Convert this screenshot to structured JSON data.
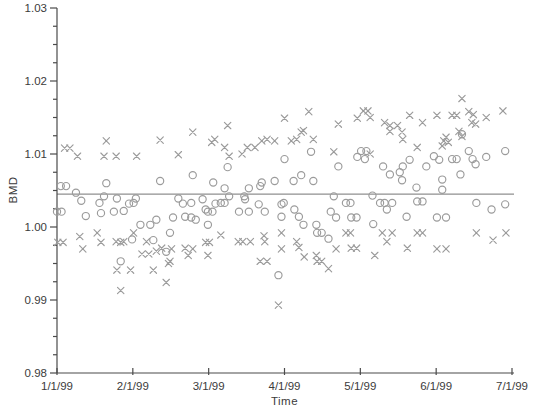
{
  "figure": {
    "background": "#ffffff",
    "axis_color": "#4a4a4a",
    "text_color": "#3b3b3b",
    "marker_color": "#9b9b9b",
    "ref_line_color": "#8f8f8f"
  },
  "chart_data": {
    "type": "scatter",
    "title": "",
    "xlabel": "Time",
    "ylabel": "BMD",
    "x_tick_labels": [
      "1/1/99",
      "2/1/99",
      "3/1/99",
      "4/1/99",
      "5/1/99",
      "6/1/99",
      "7/1/99"
    ],
    "x_range_months": [
      0,
      6
    ],
    "ylim": [
      0.98,
      1.03
    ],
    "y_ticks": [
      0.98,
      0.99,
      1.0,
      1.01,
      1.02,
      1.03
    ],
    "y_minor_step": 0.0025,
    "grid": "off",
    "legend": "none",
    "reference_line_y": 1.0045,
    "series": [
      {
        "name": "circle-series",
        "marker": "circle",
        "points": [
          [
            0.05,
            1.0056
          ],
          [
            0.12,
            1.0056
          ],
          [
            0.0,
            1.0021
          ],
          [
            0.06,
            1.0021
          ],
          [
            0.25,
            1.0047
          ],
          [
            0.32,
            1.0036
          ],
          [
            0.38,
            1.0015
          ],
          [
            0.56,
            1.0033
          ],
          [
            0.58,
            1.0019
          ],
          [
            0.62,
            1.0042
          ],
          [
            0.65,
            1.006
          ],
          [
            0.75,
            1.0021
          ],
          [
            0.79,
            1.0039
          ],
          [
            0.84,
            0.9953
          ],
          [
            0.88,
            1.0022
          ],
          [
            0.95,
            1.0032
          ],
          [
            0.99,
            0.9983
          ],
          [
            1.01,
            1.0033
          ],
          [
            1.04,
            1.0039
          ],
          [
            1.1,
            1.0003
          ],
          [
            1.23,
            1.0003
          ],
          [
            1.27,
            0.9982
          ],
          [
            1.31,
            1.001
          ],
          [
            1.36,
            1.0063
          ],
          [
            1.44,
            0.9966
          ],
          [
            1.49,
            0.9992
          ],
          [
            1.53,
            1.0013
          ],
          [
            1.6,
            1.0039
          ],
          [
            1.66,
            1.0032
          ],
          [
            1.69,
            1.0014
          ],
          [
            1.77,
            1.0033
          ],
          [
            1.77,
            1.0013
          ],
          [
            1.79,
            1.0071
          ],
          [
            1.83,
            1.001
          ],
          [
            1.92,
            1.0038
          ],
          [
            1.96,
            1.0024
          ],
          [
            1.99,
            1.0021
          ],
          [
            2.05,
            1.0021
          ],
          [
            1.99,
            1.0003
          ],
          [
            2.06,
            1.0061
          ],
          [
            2.09,
            1.0032
          ],
          [
            2.16,
            1.0033
          ],
          [
            2.21,
            1.0053
          ],
          [
            2.21,
            1.0033
          ],
          [
            2.25,
            1.0082
          ],
          [
            2.27,
            1.0042
          ],
          [
            2.4,
            1.0021
          ],
          [
            2.47,
            1.0042
          ],
          [
            2.48,
            1.0038
          ],
          [
            2.53,
            1.0053
          ],
          [
            2.53,
            1.0021
          ],
          [
            2.66,
            1.0031
          ],
          [
            2.68,
            1.0056
          ],
          [
            2.7,
            1.0061
          ],
          [
            2.74,
            1.0021
          ],
          [
            2.87,
            1.0063
          ],
          [
            2.92,
            0.9934
          ],
          [
            2.96,
            1.0031
          ],
          [
            2.96,
            1.0014
          ],
          [
            2.99,
            1.0033
          ],
          [
            3.0,
            1.0093
          ],
          [
            3.12,
            1.0063
          ],
          [
            3.13,
            1.0024
          ],
          [
            3.19,
            1.0014
          ],
          [
            3.22,
            1.0071
          ],
          [
            3.25,
            1.0003
          ],
          [
            3.35,
            1.0103
          ],
          [
            3.38,
            1.0063
          ],
          [
            3.42,
            1.0003
          ],
          [
            3.43,
            0.9992
          ],
          [
            3.49,
            0.9992
          ],
          [
            3.58,
            0.9984
          ],
          [
            3.61,
            1.0021
          ],
          [
            3.65,
            1.0042
          ],
          [
            3.68,
            1.0013
          ],
          [
            3.71,
            1.0083
          ],
          [
            3.81,
            1.0033
          ],
          [
            3.87,
            1.0033
          ],
          [
            3.88,
            1.0013
          ],
          [
            3.95,
            1.0013
          ],
          [
            3.96,
            1.0096
          ],
          [
            4.01,
            1.0104
          ],
          [
            4.08,
            1.0104
          ],
          [
            4.06,
            1.0093
          ],
          [
            4.16,
            1.0043
          ],
          [
            4.17,
            1.0004
          ],
          [
            4.26,
            1.0033
          ],
          [
            4.3,
            1.0083
          ],
          [
            4.32,
            1.0033
          ],
          [
            4.35,
            1.0024
          ],
          [
            4.39,
            1.0072
          ],
          [
            4.42,
            1.0033
          ],
          [
            4.52,
            1.0075
          ],
          [
            4.55,
            1.0064
          ],
          [
            4.56,
            1.0083
          ],
          [
            4.61,
            1.0014
          ],
          [
            4.65,
            1.0092
          ],
          [
            4.74,
            1.0054
          ],
          [
            4.75,
            1.0035
          ],
          [
            4.82,
            1.0035
          ],
          [
            4.87,
            1.0083
          ],
          [
            4.97,
            1.0097
          ],
          [
            5.01,
            1.0013
          ],
          [
            5.04,
            1.0092
          ],
          [
            5.08,
            1.0065
          ],
          [
            5.08,
            1.0051
          ],
          [
            5.13,
            1.0013
          ],
          [
            5.21,
            1.0093
          ],
          [
            5.27,
            1.0093
          ],
          [
            5.32,
            1.0072
          ],
          [
            5.34,
            1.0127
          ],
          [
            5.43,
            1.0104
          ],
          [
            5.48,
            1.0093
          ],
          [
            5.52,
            1.0086
          ],
          [
            5.53,
            1.0033
          ],
          [
            5.66,
            1.0096
          ],
          [
            5.73,
            1.0024
          ],
          [
            5.91,
            1.0104
          ],
          [
            5.91,
            1.0031
          ]
        ]
      },
      {
        "name": "x-series",
        "marker": "x",
        "points": [
          [
            0.01,
            0.9979
          ],
          [
            0.08,
            0.9979
          ],
          [
            0.1,
            1.0108
          ],
          [
            0.17,
            1.0108
          ],
          [
            0.27,
            1.0097
          ],
          [
            0.3,
            0.9987
          ],
          [
            0.34,
            0.997
          ],
          [
            0.53,
            0.9992
          ],
          [
            0.58,
            0.9979
          ],
          [
            0.62,
            1.0097
          ],
          [
            0.65,
            1.0118
          ],
          [
            0.78,
            1.0097
          ],
          [
            0.78,
            0.998
          ],
          [
            0.79,
            0.9941
          ],
          [
            0.84,
            0.9979
          ],
          [
            0.84,
            0.9913
          ],
          [
            0.88,
            0.998
          ],
          [
            0.97,
            0.9941
          ],
          [
            1.01,
            0.9992
          ],
          [
            1.05,
            1.0097
          ],
          [
            1.12,
            0.9963
          ],
          [
            1.18,
            0.998
          ],
          [
            1.21,
            0.9963
          ],
          [
            1.27,
            0.9941
          ],
          [
            1.31,
            0.9967
          ],
          [
            1.36,
            1.0119
          ],
          [
            1.38,
            0.9971
          ],
          [
            1.44,
            0.9924
          ],
          [
            1.47,
            0.995
          ],
          [
            1.49,
            0.9953
          ],
          [
            1.51,
            0.997
          ],
          [
            1.6,
            1.0099
          ],
          [
            1.69,
            0.9971
          ],
          [
            1.73,
            0.9961
          ],
          [
            1.79,
            1.013
          ],
          [
            1.79,
            0.997
          ],
          [
            1.96,
            0.9979
          ],
          [
            1.99,
            0.9961
          ],
          [
            2.01,
            0.9979
          ],
          [
            2.04,
            1.0116
          ],
          [
            2.08,
            1.012
          ],
          [
            2.16,
            0.9989
          ],
          [
            2.21,
            1.0109
          ],
          [
            2.25,
            1.0139
          ],
          [
            2.27,
            1.0097
          ],
          [
            2.39,
            0.998
          ],
          [
            2.44,
            1.01
          ],
          [
            2.45,
            0.998
          ],
          [
            2.51,
            1.0109
          ],
          [
            2.55,
            0.998
          ],
          [
            2.61,
            1.0109
          ],
          [
            2.68,
            0.9953
          ],
          [
            2.7,
            1.0118
          ],
          [
            2.73,
            0.9988
          ],
          [
            2.74,
            0.998
          ],
          [
            2.77,
            1.012
          ],
          [
            2.77,
            0.9953
          ],
          [
            2.87,
            1.0118
          ],
          [
            2.92,
            0.9893
          ],
          [
            2.96,
            0.9992
          ],
          [
            2.96,
            0.997
          ],
          [
            3.0,
            1.0149
          ],
          [
            3.09,
            1.0118
          ],
          [
            3.16,
            1.012
          ],
          [
            3.16,
            0.998
          ],
          [
            3.19,
            0.9972
          ],
          [
            3.22,
            1.013
          ],
          [
            3.25,
            1.0132
          ],
          [
            3.26,
            0.9959
          ],
          [
            3.32,
            1.0158
          ],
          [
            3.38,
            1.012
          ],
          [
            3.42,
            0.9961
          ],
          [
            3.43,
            0.9953
          ],
          [
            3.49,
            0.9953
          ],
          [
            3.58,
            0.9943
          ],
          [
            3.65,
            1.0103
          ],
          [
            3.68,
            0.997
          ],
          [
            3.71,
            1.0141
          ],
          [
            3.81,
            0.9992
          ],
          [
            3.87,
            0.9992
          ],
          [
            3.88,
            0.9971
          ],
          [
            3.95,
            0.9971
          ],
          [
            3.96,
            1.0149
          ],
          [
            4.04,
            1.0159
          ],
          [
            4.1,
            1.0159
          ],
          [
            4.13,
            1.015
          ],
          [
            4.13,
            1.01
          ],
          [
            4.19,
            0.9961
          ],
          [
            4.29,
            0.9992
          ],
          [
            4.32,
            1.0143
          ],
          [
            4.35,
            0.998
          ],
          [
            4.39,
            1.0139
          ],
          [
            4.39,
            1.0131
          ],
          [
            4.42,
            0.9992
          ],
          [
            4.49,
            1.0139
          ],
          [
            4.55,
            1.013
          ],
          [
            4.56,
            1.012
          ],
          [
            4.62,
            0.9971
          ],
          [
            4.65,
            1.0153
          ],
          [
            4.75,
            1.0109
          ],
          [
            4.75,
            0.9992
          ],
          [
            4.82,
            0.9992
          ],
          [
            4.82,
            1.0143
          ],
          [
            5.01,
            1.0153
          ],
          [
            5.01,
            0.997
          ],
          [
            5.08,
            1.0111
          ],
          [
            5.1,
            1.0118
          ],
          [
            5.13,
            1.0123
          ],
          [
            5.13,
            0.997
          ],
          [
            5.16,
            1.0116
          ],
          [
            5.21,
            1.0153
          ],
          [
            5.27,
            1.0153
          ],
          [
            5.3,
            1.0131
          ],
          [
            5.34,
            1.0176
          ],
          [
            5.34,
            1.0124
          ],
          [
            5.43,
            1.0158
          ],
          [
            5.47,
            1.0143
          ],
          [
            5.49,
            1.0154
          ],
          [
            5.52,
            1.0141
          ],
          [
            5.53,
            0.9992
          ],
          [
            5.66,
            1.015
          ],
          [
            5.75,
            0.9982
          ],
          [
            5.88,
            1.0159
          ],
          [
            5.92,
            0.9992
          ]
        ]
      }
    ]
  }
}
